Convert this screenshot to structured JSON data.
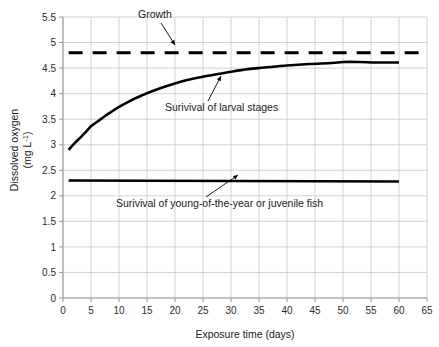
{
  "chart_data": {
    "type": "line",
    "title": "",
    "xlabel": "Exposure time (days)",
    "ylabel_line1": "Dissolved oxygen",
    "ylabel_line2_pre": "(mg L",
    "ylabel_line2_sup": "-1",
    "ylabel_line2_post": ")",
    "xlim": [
      0,
      65
    ],
    "ylim": [
      0,
      5.5
    ],
    "xticks": [
      0,
      5,
      10,
      15,
      20,
      25,
      30,
      35,
      40,
      45,
      50,
      55,
      60,
      65
    ],
    "xtick_labels": [
      "0",
      "5",
      "10",
      "15",
      "20",
      "25",
      "30",
      "35",
      "40",
      "45",
      "50",
      "55",
      "60",
      "65"
    ],
    "yticks": [
      0,
      0.5,
      1,
      1.5,
      2,
      2.5,
      3,
      3.5,
      4,
      4.5,
      5,
      5.5
    ],
    "ytick_labels": [
      "0",
      "0.5",
      "1",
      "1.5",
      "2",
      "2.5",
      "3",
      "3.5",
      "4",
      "4.5",
      "5",
      "5.5"
    ],
    "grid": true,
    "grid_color": "#c8c8c8",
    "axis_color": "#9a9a9a",
    "line_color": "#000000",
    "legend": "none",
    "series": [
      {
        "name": "Growth",
        "style": "dashed",
        "x": [
          1,
          65
        ],
        "values": [
          4.8,
          4.8
        ]
      },
      {
        "name": "Surivival of larval stages",
        "style": "solid",
        "x": [
          1,
          2,
          3,
          4,
          5,
          6,
          7,
          8,
          9,
          10,
          12,
          14,
          16,
          18,
          20,
          22,
          25,
          28,
          30,
          33,
          36,
          40,
          44,
          48,
          50,
          53,
          56,
          60
        ],
        "values": [
          2.9,
          3.02,
          3.13,
          3.24,
          3.36,
          3.44,
          3.52,
          3.6,
          3.67,
          3.74,
          3.86,
          3.96,
          4.05,
          4.13,
          4.2,
          4.26,
          4.33,
          4.39,
          4.43,
          4.48,
          4.51,
          4.55,
          4.58,
          4.6,
          4.62,
          4.62,
          4.61,
          4.61
        ]
      },
      {
        "name": "Surivival of young-of-the-year or juvenile fish",
        "style": "solid",
        "x": [
          1,
          60
        ],
        "values": [
          2.3,
          2.28
        ]
      }
    ],
    "annotations": [
      {
        "label": "Growth",
        "text_x": 138,
        "text_y": 18,
        "leader_from_x": 161,
        "leader_from_y": 23,
        "leader_to_x": 175,
        "leader_to_y": 45
      },
      {
        "label": "Surivival of larval stages",
        "text_x": 165,
        "text_y": 111,
        "leader_from_x": 208,
        "leader_from_y": 101,
        "leader_to_x": 221,
        "leader_to_y": 76
      },
      {
        "label": "Surivival of young-of-the-year or juvenile fish",
        "text_x": 116,
        "text_y": 207,
        "leader_from_x": 206,
        "leader_from_y": 197,
        "leader_to_x": 238,
        "leader_to_y": 175
      }
    ]
  }
}
